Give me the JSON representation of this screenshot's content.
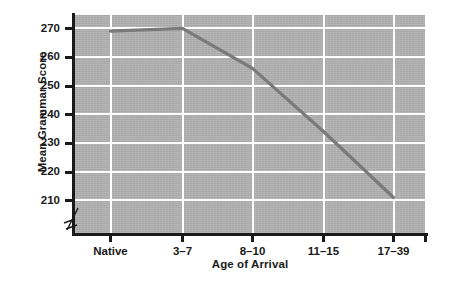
{
  "chart_data": {
    "type": "line",
    "title": "",
    "xlabel": "Age of Arrival",
    "ylabel": "Mean Grammar Score",
    "categories": [
      "Native",
      "3–7",
      "8–10",
      "11–15",
      "17–39"
    ],
    "values": [
      269,
      270,
      256,
      234,
      211
    ],
    "series": [
      {
        "name": "Mean Grammar Score",
        "values": [
          269,
          270,
          256,
          234,
          211
        ]
      }
    ],
    "ylim": [
      205,
      275
    ],
    "yticks": [
      210,
      220,
      230,
      240,
      250,
      260,
      270
    ],
    "ytick_labels": [
      "210",
      "220",
      "230",
      "240",
      "250",
      "260",
      "270"
    ],
    "xtick_labels": [
      "Native",
      "3–7",
      "8–10",
      "11–15",
      "17–39"
    ],
    "grid": true,
    "grid_color": "#ffffff",
    "plot_background": "#b3b3b3",
    "line_color": "#7a7a7a",
    "axis_color": "#1a1a1a",
    "legend": null,
    "legend_position": "none",
    "axis_break": true,
    "annotations": []
  },
  "axes": {
    "y_title": "Mean Grammar Score",
    "x_title": "Age of Arrival"
  }
}
